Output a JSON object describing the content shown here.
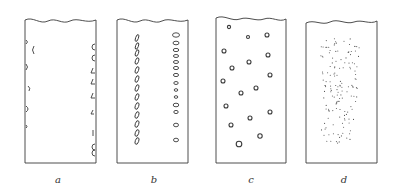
{
  "figure": {
    "background": "#ffffff",
    "stroke": "#3a3a3a",
    "panels": [
      {
        "id": "a",
        "label": "a",
        "x": 25,
        "w": 71,
        "label_x": 58,
        "description": "bubbles attached to tube walls"
      },
      {
        "id": "b",
        "label": "b",
        "x": 117,
        "w": 71,
        "label_x": 154,
        "description": "two vertical columns of elongated bubbles"
      },
      {
        "id": "c",
        "label": "c",
        "x": 216,
        "w": 70,
        "label_x": 251,
        "description": "scattered small round bubbles",
        "bubbles": [
          [
            229,
            27,
            1.6
          ],
          [
            248,
            37,
            1.5
          ],
          [
            267,
            35,
            2
          ],
          [
            224,
            51,
            2
          ],
          [
            268,
            55,
            2
          ],
          [
            249,
            62,
            2
          ],
          [
            232,
            68,
            2
          ],
          [
            270,
            75,
            2
          ],
          [
            223,
            81,
            2
          ],
          [
            241,
            93,
            2
          ],
          [
            256,
            88,
            2
          ],
          [
            226,
            106,
            2
          ],
          [
            270,
            112,
            2
          ],
          [
            250,
            118,
            2
          ],
          [
            231,
            125,
            2
          ],
          [
            260,
            136,
            2.2
          ],
          [
            239,
            144,
            2.8
          ]
        ]
      },
      {
        "id": "d",
        "label": "d",
        "x": 306,
        "w": 71,
        "label_x": 344,
        "description": "dense cloud of fine bubbles"
      }
    ],
    "top_y": 20,
    "bottom_y": 163
  }
}
